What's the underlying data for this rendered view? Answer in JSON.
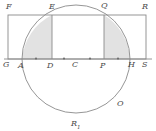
{
  "figure": {
    "type": "geometry-diagram",
    "canvas": {
      "width": 156,
      "height": 131
    },
    "colors": {
      "stroke": "#7a7a7a",
      "shade_fill": "#e2e2e2",
      "label_color": "#4a4a4a",
      "background": "#ffffff"
    },
    "circle": {
      "center_label": "C",
      "center_x": 76,
      "center_y": 59,
      "radius": 54
    },
    "rectangle": {
      "corners": [
        "F",
        "R",
        "S",
        "G"
      ],
      "left_x": 8,
      "right_x": 146,
      "top_y": 15,
      "bottom_y": 59
    },
    "baseline": {
      "y": 59,
      "from_x": 4,
      "to_x": 152
    },
    "chords": [
      {
        "name": "DE",
        "x": 52,
        "top_label": "E",
        "bottom_label": "D"
      },
      {
        "name": "PQ",
        "x": 104,
        "top_label": "Q",
        "bottom_label": "P"
      }
    ],
    "shaded_regions": [
      {
        "name": "left-segment",
        "between": [
          "A",
          "D",
          "E"
        ]
      },
      {
        "name": "right-segment",
        "between": [
          "P",
          "Q",
          "H"
        ]
      }
    ],
    "tick_points": [
      {
        "x": 36,
        "y": 59
      },
      {
        "x": 64,
        "y": 59
      },
      {
        "x": 90,
        "y": 59
      },
      {
        "x": 118,
        "y": 59
      }
    ],
    "labels": [
      {
        "id": "F",
        "text": "F",
        "x": 6,
        "y": 3,
        "name": "label-F"
      },
      {
        "id": "E",
        "text": "E",
        "x": 49,
        "y": 3,
        "name": "label-E"
      },
      {
        "id": "Q",
        "text": "Q",
        "x": 101,
        "y": 2,
        "name": "label-Q"
      },
      {
        "id": "R",
        "text": "R",
        "x": 142,
        "y": 3,
        "name": "label-R"
      },
      {
        "id": "G",
        "text": "G",
        "x": 3,
        "y": 61,
        "name": "label-G"
      },
      {
        "id": "A",
        "text": "A",
        "x": 18,
        "y": 62,
        "name": "label-A"
      },
      {
        "id": "D",
        "text": "D",
        "x": 47,
        "y": 62,
        "name": "label-D"
      },
      {
        "id": "C",
        "text": "C",
        "x": 72,
        "y": 61,
        "name": "label-C"
      },
      {
        "id": "P",
        "text": "P",
        "x": 100,
        "y": 62,
        "name": "label-P"
      },
      {
        "id": "H",
        "text": "H",
        "x": 128,
        "y": 61,
        "name": "label-H"
      },
      {
        "id": "S",
        "text": "S",
        "x": 142,
        "y": 61,
        "name": "label-S"
      },
      {
        "id": "O",
        "text": "O",
        "x": 117,
        "y": 100,
        "name": "label-O"
      },
      {
        "id": "R1",
        "text": "R",
        "sub": "1",
        "x": 71,
        "y": 120,
        "name": "label-R1"
      }
    ]
  }
}
